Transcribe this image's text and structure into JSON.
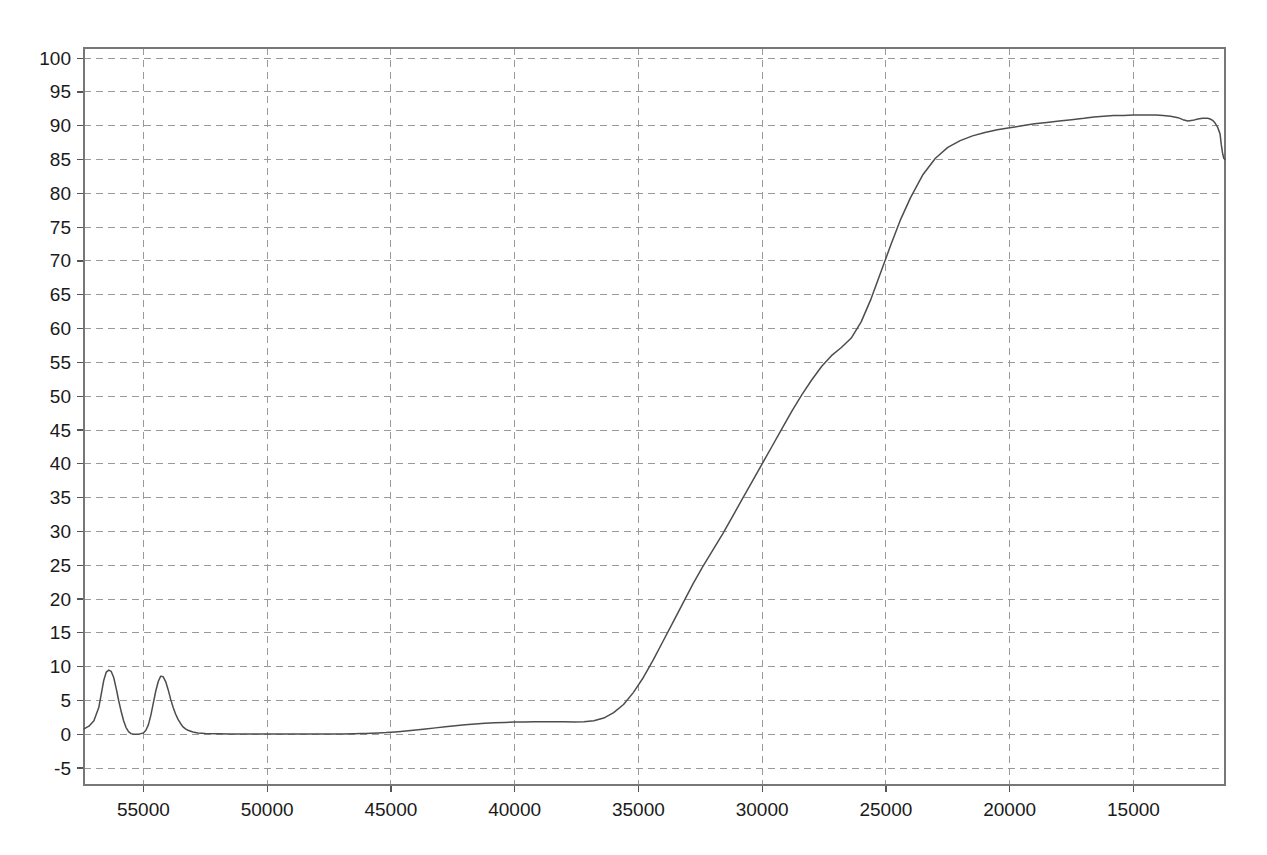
{
  "chart_data": {
    "type": "line",
    "title": "",
    "subtitle": "",
    "xlabel": "",
    "ylabel": "",
    "xlim": [
      57400,
      11300
    ],
    "ylim": [
      -7.5,
      101.5
    ],
    "x_reversed": true,
    "grid": true,
    "legend": null,
    "legend_position": "none",
    "x_ticks": [
      55000,
      50000,
      45000,
      40000,
      35000,
      30000,
      25000,
      20000,
      15000
    ],
    "x_tick_labels": [
      "55000",
      "50000",
      "45000",
      "40000",
      "35000",
      "30000",
      "25000",
      "20000",
      "15000"
    ],
    "y_ticks": [
      -5,
      0,
      5,
      10,
      15,
      20,
      25,
      30,
      35,
      40,
      45,
      50,
      55,
      60,
      65,
      70,
      75,
      80,
      85,
      90,
      95,
      100
    ],
    "y_tick_labels": [
      "-5",
      "0",
      "5",
      "10",
      "15",
      "20",
      "25",
      "30",
      "35",
      "40",
      "45",
      "50",
      "55",
      "60",
      "65",
      "70",
      "75",
      "80",
      "85",
      "90",
      "95",
      "100"
    ],
    "curve_color": "#4d4d4d",
    "grid_color": "#9a9a9a",
    "series": [
      {
        "name": "transmittance",
        "x": [
          57400,
          57200,
          57000,
          56800,
          56700,
          56600,
          56500,
          56400,
          56300,
          56200,
          56100,
          56000,
          55900,
          55800,
          55700,
          55600,
          55500,
          55400,
          55300,
          55200,
          55100,
          55000,
          54900,
          54800,
          54700,
          54600,
          54500,
          54400,
          54300,
          54200,
          54100,
          54000,
          53900,
          53800,
          53700,
          53600,
          53500,
          53400,
          53300,
          53200,
          53000,
          52800,
          52500,
          52000,
          51500,
          51000,
          50000,
          49000,
          48000,
          47000,
          46500,
          46200,
          46000,
          45800,
          45500,
          45200,
          45000,
          44700,
          44400,
          44000,
          43600,
          43200,
          42800,
          42400,
          42000,
          41600,
          41200,
          40800,
          40400,
          40000,
          39600,
          39200,
          38800,
          38400,
          38000,
          37600,
          37200,
          36800,
          36400,
          36000,
          35600,
          35200,
          34800,
          34400,
          34000,
          33600,
          33200,
          32800,
          32400,
          32000,
          31600,
          31200,
          30800,
          30400,
          30000,
          29600,
          29200,
          28800,
          28400,
          28000,
          27600,
          27200,
          26800,
          26400,
          26000,
          25600,
          25200,
          24800,
          24400,
          24000,
          23500,
          23000,
          22500,
          22000,
          21500,
          21000,
          20500,
          20000,
          19500,
          19000,
          18500,
          18000,
          17500,
          17000,
          16600,
          16200,
          15800,
          15400,
          15000,
          14700,
          14400,
          14100,
          13800,
          13500,
          13200,
          13000,
          12800,
          12600,
          12400,
          12200,
          12000,
          11900,
          11800,
          11700,
          11600,
          11500,
          11450,
          11400,
          11350,
          11300
        ],
        "y": [
          0.8,
          1.2,
          2.0,
          4.0,
          6.0,
          8.0,
          9.2,
          9.5,
          9.3,
          8.4,
          6.8,
          5.0,
          3.4,
          2.0,
          1.0,
          0.4,
          0.1,
          0.0,
          0.0,
          0.0,
          0.1,
          0.2,
          0.6,
          1.4,
          2.8,
          4.6,
          6.4,
          7.8,
          8.6,
          8.5,
          7.8,
          6.6,
          5.2,
          4.0,
          3.0,
          2.2,
          1.6,
          1.1,
          0.8,
          0.6,
          0.35,
          0.2,
          0.12,
          0.08,
          0.06,
          0.05,
          0.05,
          0.05,
          0.05,
          0.06,
          0.08,
          0.1,
          0.12,
          0.15,
          0.2,
          0.25,
          0.3,
          0.38,
          0.48,
          0.62,
          0.78,
          0.95,
          1.1,
          1.25,
          1.4,
          1.52,
          1.62,
          1.7,
          1.76,
          1.8,
          1.82,
          1.84,
          1.85,
          1.85,
          1.84,
          1.82,
          1.85,
          2.0,
          2.4,
          3.2,
          4.4,
          6.2,
          8.4,
          11.0,
          13.8,
          16.6,
          19.4,
          22.2,
          24.8,
          27.2,
          29.6,
          32.2,
          34.8,
          37.4,
          40.0,
          42.6,
          45.2,
          47.8,
          50.2,
          52.4,
          54.4,
          56.0,
          57.2,
          58.6,
          61.0,
          64.4,
          68.4,
          72.4,
          76.2,
          79.4,
          82.8,
          85.2,
          86.8,
          87.8,
          88.5,
          89.0,
          89.4,
          89.7,
          90.0,
          90.3,
          90.5,
          90.7,
          90.9,
          91.1,
          91.3,
          91.4,
          91.5,
          91.5,
          91.6,
          91.6,
          91.6,
          91.6,
          91.5,
          91.4,
          91.2,
          90.9,
          90.7,
          90.8,
          91.0,
          91.1,
          91.1,
          91.0,
          90.8,
          90.4,
          89.8,
          88.8,
          87.2,
          86.0,
          85.2,
          85.0
        ]
      }
    ]
  },
  "axes": {
    "plot_left_px": 84,
    "plot_right_px": 1225,
    "plot_top_px": 48,
    "plot_bottom_px": 785
  }
}
